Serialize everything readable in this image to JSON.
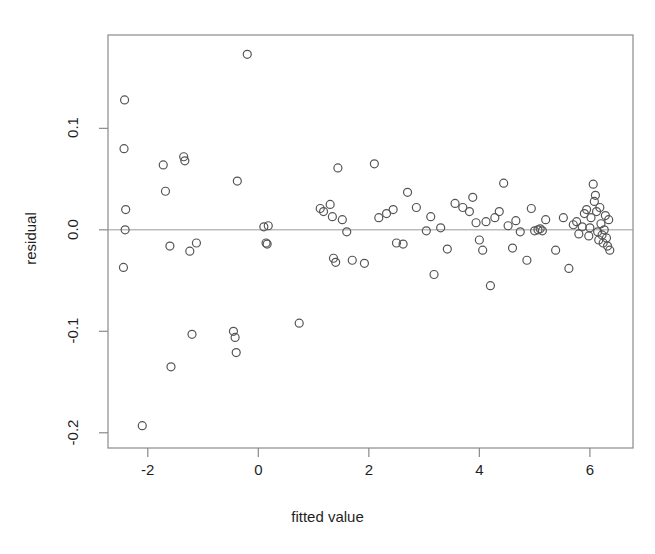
{
  "figure": {
    "title": "",
    "background": "#ffffff",
    "width": 655,
    "height": 554
  },
  "axes": {
    "xlabel": "fitted value",
    "ylabel": "residual",
    "x_ticks": [
      "-2",
      "0",
      "2",
      "4",
      "6"
    ],
    "y_ticks": [
      "0.1",
      "0.0",
      "-0.1",
      "-0.2"
    ],
    "frame_color": "#8a8a8a",
    "zero_line_color": "#9a9a9a",
    "marker_color": "#555555",
    "marker_radius": 4.0
  },
  "chart_data": {
    "type": "scatter",
    "title": "",
    "xlabel": "fitted value",
    "ylabel": "residual",
    "xlim": [
      -2.72,
      6.78
    ],
    "ylim": [
      -0.215,
      0.192
    ],
    "xticks": [
      -2,
      0,
      2,
      4,
      6
    ],
    "yticks": [
      0.1,
      0.0,
      -0.1,
      -0.2
    ],
    "grid": false,
    "legend": null,
    "annotations": [
      {
        "type": "hline",
        "y": 0.0,
        "label": "zero residual reference line"
      }
    ],
    "marker": "open-circle",
    "n_points": 100,
    "series": [
      {
        "name": "residuals",
        "x": [
          -2.42,
          -2.43,
          -2.4,
          -2.41,
          -2.44,
          -2.1,
          -1.72,
          -1.68,
          -1.6,
          -1.58,
          -1.35,
          -1.33,
          -1.24,
          -1.2,
          -1.12,
          -0.45,
          -0.42,
          -0.4,
          -0.38,
          -0.2,
          0.1,
          0.14,
          0.16,
          0.18,
          0.74,
          1.12,
          1.18,
          1.3,
          1.34,
          1.36,
          1.4,
          1.44,
          1.52,
          1.6,
          1.7,
          1.92,
          2.1,
          2.18,
          2.32,
          2.44,
          2.5,
          2.62,
          2.7,
          2.86,
          3.04,
          3.12,
          3.18,
          3.3,
          3.42,
          3.56,
          3.7,
          3.82,
          3.88,
          3.94,
          4.0,
          4.06,
          4.12,
          4.2,
          4.28,
          4.36,
          4.44,
          4.52,
          4.6,
          4.66,
          4.74,
          4.86,
          4.94,
          5.0,
          5.06,
          5.1,
          5.14,
          5.2,
          5.38,
          5.52,
          5.62,
          5.7,
          5.76,
          5.8,
          5.86,
          5.9,
          5.94,
          5.98,
          6.0,
          6.02,
          6.06,
          6.08,
          6.1,
          6.12,
          6.14,
          6.16,
          6.18,
          6.2,
          6.22,
          6.24,
          6.26,
          6.28,
          6.3,
          6.32,
          6.34,
          6.36
        ],
        "y": [
          0.128,
          0.08,
          0.02,
          0.0,
          -0.037,
          -0.193,
          0.064,
          0.038,
          -0.016,
          -0.135,
          0.072,
          0.068,
          -0.021,
          -0.103,
          -0.013,
          -0.1,
          -0.106,
          -0.121,
          0.048,
          0.173,
          0.003,
          -0.013,
          -0.014,
          0.004,
          -0.092,
          0.021,
          0.018,
          0.025,
          0.013,
          -0.028,
          -0.032,
          0.061,
          0.01,
          -0.002,
          -0.03,
          -0.033,
          0.065,
          0.012,
          0.016,
          0.02,
          -0.013,
          -0.014,
          0.037,
          0.022,
          -0.001,
          0.013,
          -0.044,
          0.002,
          -0.019,
          0.026,
          0.022,
          0.018,
          0.032,
          0.007,
          -0.01,
          -0.02,
          0.008,
          -0.055,
          0.012,
          0.018,
          0.046,
          0.004,
          -0.018,
          0.009,
          -0.002,
          -0.03,
          0.021,
          -0.001,
          0.0,
          0.001,
          -0.001,
          0.01,
          -0.02,
          0.012,
          -0.038,
          0.005,
          0.008,
          -0.004,
          0.003,
          0.016,
          0.02,
          -0.006,
          0.002,
          0.012,
          0.045,
          0.028,
          0.034,
          0.018,
          -0.002,
          -0.01,
          0.022,
          0.006,
          -0.005,
          -0.013,
          0.0,
          0.014,
          -0.008,
          -0.016,
          0.01,
          -0.02
        ]
      }
    ]
  }
}
